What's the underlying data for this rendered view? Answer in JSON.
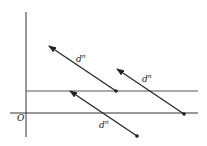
{
  "diagram": {
    "origin_label": "O",
    "vectors": [
      {
        "label": "d",
        "superscript": "n"
      },
      {
        "label": "d",
        "superscript": "n"
      },
      {
        "label": "d",
        "superscript": "n"
      }
    ],
    "colors": {
      "line": "#222222",
      "background": "#ffffff"
    }
  }
}
